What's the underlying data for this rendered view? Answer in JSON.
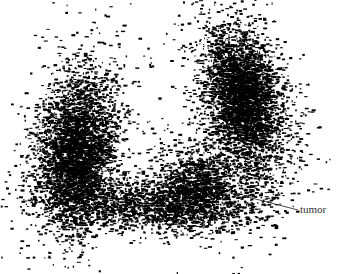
{
  "figure": {
    "width": 339,
    "height": 274,
    "background": "#ffffff",
    "ink": "#000000",
    "annotation": {
      "label": "tumor",
      "line": {
        "x1": 244,
        "y1": 196,
        "x2": 298,
        "y2": 210
      },
      "text_x": 300,
      "text_y": 213,
      "color": "#333333"
    },
    "clusters": [
      {
        "name": "left-lobe",
        "cx": 75,
        "cy": 150,
        "sx": 22,
        "sy": 45,
        "n": 2600,
        "rot": 0.15
      },
      {
        "name": "left-lobe-core",
        "cx": 80,
        "cy": 160,
        "sx": 16,
        "sy": 30,
        "n": 1400,
        "rot": 0.1
      },
      {
        "name": "right-lobe",
        "cx": 245,
        "cy": 100,
        "sx": 22,
        "sy": 42,
        "n": 2400,
        "rot": -0.25
      },
      {
        "name": "right-lobe-core",
        "cx": 240,
        "cy": 95,
        "sx": 15,
        "sy": 28,
        "n": 1400,
        "rot": -0.2
      },
      {
        "name": "bottom-bridge",
        "cx": 150,
        "cy": 205,
        "sx": 45,
        "sy": 14,
        "n": 1500,
        "rot": 0.0
      },
      {
        "name": "lower-right-mass",
        "cx": 200,
        "cy": 185,
        "sx": 22,
        "sy": 22,
        "n": 1300,
        "rot": -0.4
      },
      {
        "name": "tumor-region",
        "cx": 255,
        "cy": 195,
        "sx": 18,
        "sy": 18,
        "n": 120,
        "rot": 0.0
      },
      {
        "name": "sparse-halo",
        "cx": 170,
        "cy": 150,
        "sx": 85,
        "sy": 60,
        "n": 250,
        "rot": 0.0
      }
    ],
    "seed": 1234
  }
}
